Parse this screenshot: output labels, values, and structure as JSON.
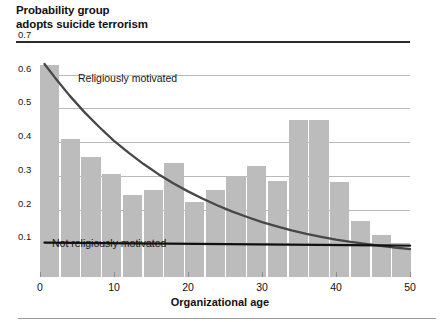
{
  "figure": {
    "title": "Probability group\nadopts suicide terrorism"
  },
  "chart_data": {
    "type": "bar",
    "title": "Probability group adopts suicide terrorism",
    "xlabel": "Organizational age",
    "ylabel": "Probability group adopts suicide terrorism",
    "xlim": [
      0,
      52
    ],
    "ylim": [
      0,
      0.7
    ],
    "grid": true,
    "legend": "inline-annotations",
    "xticks": [
      "0",
      "10",
      "20",
      "30",
      "40",
      "50"
    ],
    "xtick_values": [
      0,
      10,
      20,
      30,
      40,
      50
    ],
    "yticks": [
      "0.1",
      "0.2",
      "0.3",
      "0.4",
      "0.5",
      "0.6",
      "0.7"
    ],
    "ytick_values": [
      0.1,
      0.2,
      0.3,
      0.4,
      0.5,
      0.6,
      0.7
    ],
    "bar_color": "#bcbcbc",
    "bars": {
      "x_left": [
        0,
        2.8,
        5.6,
        8.4,
        11.2,
        14,
        16.8,
        19.6,
        22.4,
        25.2,
        28,
        30.8,
        33.6,
        36.4,
        39.2,
        42,
        44.8,
        47.6
      ],
      "width": 2.6,
      "values": [
        0.63,
        0.41,
        0.355,
        0.305,
        0.243,
        0.258,
        0.337,
        0.222,
        0.257,
        0.3,
        0.33,
        0.284,
        0.465,
        0.465,
        0.282,
        0.165,
        0.125,
        0.085
      ]
    },
    "series": [
      {
        "name": "Religiously motivated",
        "type": "line",
        "color": "#474747",
        "label_position": {
          "x": 10.5,
          "y": 0.615
        },
        "points_x": [
          0.6,
          2,
          4,
          6,
          8,
          10,
          12,
          14,
          16,
          18,
          20,
          22,
          24,
          26,
          28,
          30,
          32,
          34,
          36,
          38,
          40,
          42,
          44,
          46,
          48,
          50
        ],
        "points_y": [
          0.632,
          0.592,
          0.538,
          0.489,
          0.445,
          0.404,
          0.368,
          0.335,
          0.305,
          0.278,
          0.254,
          0.232,
          0.212,
          0.194,
          0.178,
          0.163,
          0.15,
          0.138,
          0.128,
          0.119,
          0.111,
          0.104,
          0.098,
          0.092,
          0.087,
          0.083
        ]
      },
      {
        "name": "Not religiously motivated",
        "type": "line",
        "color": "#111111",
        "label_position": {
          "x": 2.2,
          "y": 0.128
        },
        "points_x": [
          0.6,
          50
        ],
        "points_y": [
          0.102,
          0.093
        ]
      }
    ]
  },
  "annotations": {
    "religiously_motivated": "Religiously motivated",
    "not_religiously_motivated": "Not religiously motivated"
  },
  "axis": {
    "x_title": "Organizational age"
  },
  "colors": {
    "bar": "#bcbcbc",
    "grid": "#b9b9b9",
    "frame": "#2b2b2b",
    "curve_religious": "#474747",
    "curve_secular": "#111111"
  }
}
